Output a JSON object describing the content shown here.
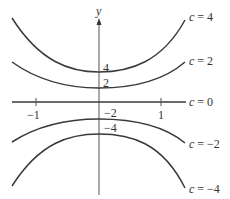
{
  "diagram": {
    "axis_label_y": "y",
    "x_ticks": [
      {
        "label": "−1",
        "value": -1
      },
      {
        "label": "1",
        "value": 1
      }
    ],
    "intercept_labels": [
      {
        "label": "4",
        "value": 4
      },
      {
        "label": "2",
        "value": 2
      },
      {
        "label": "−2",
        "value": -2
      },
      {
        "label": "−4",
        "value": -4
      }
    ],
    "curves": [
      {
        "c_var": "c",
        "eq": " = 4",
        "value": 4
      },
      {
        "c_var": "c",
        "eq": " = 2",
        "value": 2
      },
      {
        "c_var": "c",
        "eq": " = 0",
        "value": 0
      },
      {
        "c_var": "c",
        "eq": " = −2",
        "value": -2
      },
      {
        "c_var": "c",
        "eq": " = −4",
        "value": -4
      }
    ],
    "line_color": "#3a3a3a"
  }
}
